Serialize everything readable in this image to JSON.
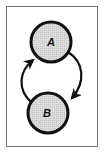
{
  "diagram": {
    "type": "state-cycle",
    "nodes": [
      {
        "id": "A",
        "label": "A",
        "cx": 51,
        "cy": 42,
        "r": 20
      },
      {
        "id": "B",
        "label": "B",
        "cx": 48,
        "cy": 113,
        "r": 20
      }
    ],
    "edges": [
      {
        "from": "A",
        "to": "B",
        "side": "right"
      },
      {
        "from": "B",
        "to": "A",
        "side": "left"
      }
    ],
    "colors": {
      "node_fill": "#d4d4d4",
      "stroke": "#111111",
      "frame": "#777777",
      "background": "#ffffff"
    }
  }
}
